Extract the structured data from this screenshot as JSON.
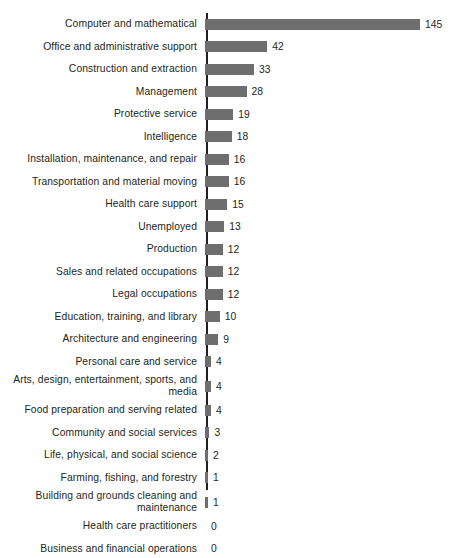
{
  "chart_data": {
    "type": "bar",
    "orientation": "horizontal",
    "title": "",
    "subtitle": "",
    "xlabel": "",
    "ylabel": "",
    "grid": false,
    "legend": false,
    "legend_position": "none",
    "axis_color": "#231f20",
    "bar_color": "#6e6e6e",
    "background": "#ffffff",
    "xlim": [
      0,
      145
    ],
    "value_labels": true,
    "categories": [
      "Computer and mathematical",
      "Office and administrative support",
      "Construction and extraction",
      "Management",
      "Protective service",
      "Intelligence",
      "Installation, maintenance, and repair",
      "Transportation and material moving",
      "Health care support",
      "Unemployed",
      "Production",
      "Sales and related occupations",
      "Legal occupations",
      "Education, training, and library",
      "Architecture and engineering",
      "Personal care and service",
      "Arts, design, entertainment, sports, and\nmedia",
      "Food preparation and serving related",
      "Community and social services",
      "Life, physical, and social science",
      "Farming, fishing, and forestry",
      "Building and grounds cleaning and\nmaintenance",
      "Health care practitioners",
      "Business and financial operations"
    ],
    "values": [
      145,
      42,
      33,
      28,
      19,
      18,
      16,
      16,
      15,
      13,
      12,
      12,
      12,
      10,
      9,
      4,
      4,
      4,
      3,
      2,
      1,
      1,
      0,
      0
    ]
  }
}
